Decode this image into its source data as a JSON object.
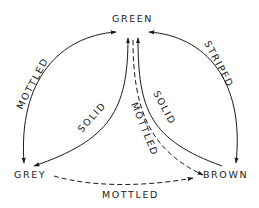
{
  "diagram": {
    "type": "state-transition",
    "nodes": [
      {
        "id": "green",
        "label": "GREEN"
      },
      {
        "id": "grey",
        "label": "GREY"
      },
      {
        "id": "brown",
        "label": "BROWN"
      }
    ],
    "edges": [
      {
        "id": "green-grey",
        "from": "green",
        "to": "grey",
        "label": "MOTTLED",
        "style": "solid",
        "direction": "both"
      },
      {
        "id": "green-brown",
        "from": "green",
        "to": "brown",
        "label": "STRIPED",
        "style": "solid",
        "direction": "both"
      },
      {
        "id": "grey-green",
        "from": "grey",
        "to": "green",
        "label": "SOLID",
        "style": "solid",
        "direction": "forward"
      },
      {
        "id": "brown-green",
        "from": "brown",
        "to": "green",
        "label": "SOLID",
        "style": "solid",
        "direction": "forward"
      },
      {
        "id": "green-brown-dashed",
        "from": "green",
        "to": "brown",
        "label": "MOTTLED",
        "style": "dashed",
        "direction": "forward"
      },
      {
        "id": "grey-brown",
        "from": "grey",
        "to": "brown",
        "label": "MOTTLED",
        "style": "dashed",
        "direction": "forward"
      }
    ],
    "colors": {
      "ink": "#1a1a1a",
      "background": "#ffffff"
    }
  }
}
